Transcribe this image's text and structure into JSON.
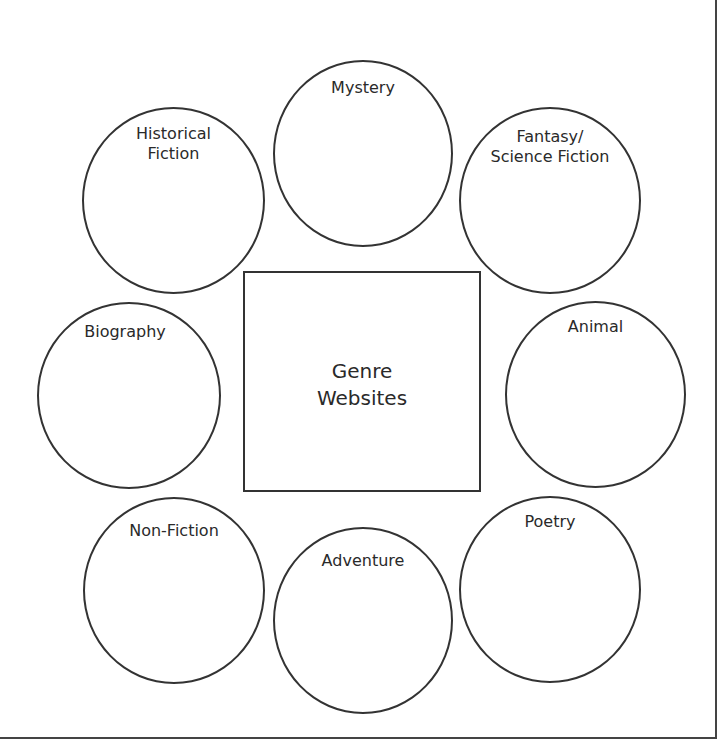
{
  "diagram": {
    "center": {
      "label": "Genre\nWebsites"
    },
    "genres": [
      {
        "id": "mystery",
        "label": "Mystery"
      },
      {
        "id": "fantasy-science-fiction",
        "label": "Fantasy/\nScience Fiction"
      },
      {
        "id": "animal",
        "label": "Animal"
      },
      {
        "id": "poetry",
        "label": "Poetry"
      },
      {
        "id": "adventure",
        "label": "Adventure"
      },
      {
        "id": "non-fiction",
        "label": "Non-Fiction"
      },
      {
        "id": "biography",
        "label": "Biography"
      },
      {
        "id": "historical-fiction",
        "label": "Historical\nFiction"
      }
    ]
  }
}
